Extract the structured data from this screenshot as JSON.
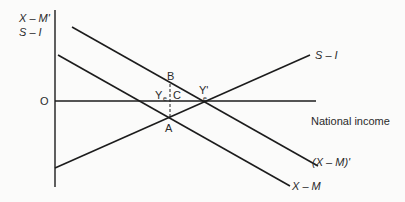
{
  "diagram": {
    "type": "economics-line-diagram",
    "y_axis_label_line1": "X – M'",
    "y_axis_label_line2": "S – I",
    "origin_label": "O",
    "x_axis_label": "National income",
    "lines": [
      {
        "id": "s-minus-i",
        "label": "S – I",
        "x1": 55,
        "y1": 168,
        "x2": 310,
        "y2": 55
      },
      {
        "id": "x-minus-m-prime",
        "label": "(X – M)'",
        "x1": 72,
        "y1": 27,
        "x2": 318,
        "y2": 166
      },
      {
        "id": "x-minus-m",
        "label": "X – M",
        "x1": 58,
        "y1": 55,
        "x2": 290,
        "y2": 186
      }
    ],
    "points": {
      "A": "A",
      "B": "B",
      "C": "C",
      "Ye": "Y",
      "Ye_sub": "e",
      "Ye_prime": "Y'",
      "Ye_prime_sub": "e"
    },
    "colors": {
      "line": "#1c1c1c",
      "background": "#fbfbfa",
      "text": "#2a2a2a"
    }
  }
}
